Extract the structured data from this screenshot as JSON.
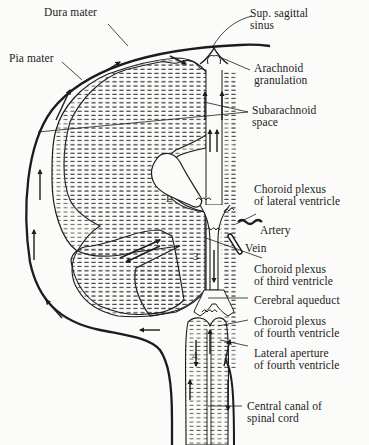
{
  "figure": {
    "colors": {
      "ink": "#1c1c1c",
      "paper": "#fbfbf9",
      "tissue_hatch": "#4a4a4a"
    },
    "labels": [
      {
        "id": "dura-mater",
        "lines": [
          "Dura mater"
        ]
      },
      {
        "id": "pia-mater",
        "lines": [
          "Pia mater"
        ]
      },
      {
        "id": "sup-sagittal-sinus",
        "lines": [
          "Sup. sagittal",
          "sinus"
        ]
      },
      {
        "id": "arachnoid-granulation",
        "lines": [
          "Arachnoid",
          "granulation"
        ]
      },
      {
        "id": "subarachnoid-space",
        "lines": [
          "Subarachnoid",
          "space"
        ]
      },
      {
        "id": "choroid-plexus-lateral",
        "lines": [
          "Choroid plexus",
          "of lateral ventricle"
        ]
      },
      {
        "id": "artery",
        "lines": [
          "Artery"
        ]
      },
      {
        "id": "vein",
        "lines": [
          "Vein"
        ]
      },
      {
        "id": "choroid-plexus-third",
        "lines": [
          "Choroid plexus",
          "of third ventricle"
        ]
      },
      {
        "id": "cerebral-aqueduct",
        "lines": [
          "Cerebral aqueduct"
        ]
      },
      {
        "id": "choroid-plexus-fourth",
        "lines": [
          "Choroid plexus",
          "of fourth ventricle"
        ]
      },
      {
        "id": "lateral-aperture",
        "lines": [
          "Lateral aperture",
          "of fourth ventricle"
        ]
      },
      {
        "id": "central-canal",
        "lines": [
          "Central canal of",
          "spinal cord"
        ]
      }
    ],
    "ventricle_markers": {
      "lateral": "L",
      "third": "3",
      "fourth": "4"
    }
  }
}
